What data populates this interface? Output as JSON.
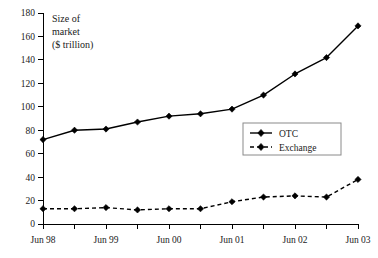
{
  "chart_data": {
    "type": "line",
    "title": "",
    "ylabel_lines": [
      "Size of",
      "market",
      "($ trillion)"
    ],
    "xlabel": "",
    "ylim": [
      0,
      180
    ],
    "yticks": [
      0,
      20,
      40,
      60,
      80,
      100,
      120,
      140,
      160,
      180
    ],
    "ytick_labels": [
      "0",
      "20",
      "40",
      "60",
      "80",
      "100",
      "120",
      "140",
      "160",
      "180"
    ],
    "x": [
      "Jun 98",
      "Dec 98",
      "Jun 99",
      "Dec 99",
      "Jun 00",
      "Dec 00",
      "Jun 01",
      "Dec 01",
      "Jun 02",
      "Dec 02",
      "Jun 03"
    ],
    "xtick_labels": [
      "Jun 98",
      "Jun 99",
      "Jun 00",
      "Jun 01",
      "Jun 02",
      "Jun 03"
    ],
    "xtick_indices": [
      0,
      2,
      4,
      6,
      8,
      10
    ],
    "minor_ticks": true,
    "grid": false,
    "legend_position": "center-right",
    "series": [
      {
        "name": "OTC",
        "style": "solid",
        "marker": "diamond",
        "color": "#000000",
        "values": [
          72,
          80,
          81,
          87,
          92,
          94,
          98,
          110,
          128,
          142,
          169
        ]
      },
      {
        "name": "Exchange",
        "style": "dashed",
        "marker": "diamond",
        "color": "#000000",
        "values": [
          13,
          13,
          14,
          12,
          13,
          13,
          19,
          23,
          24,
          23,
          38
        ]
      }
    ]
  },
  "legend": {
    "items": [
      {
        "label": "OTC"
      },
      {
        "label": "Exchange"
      }
    ]
  }
}
